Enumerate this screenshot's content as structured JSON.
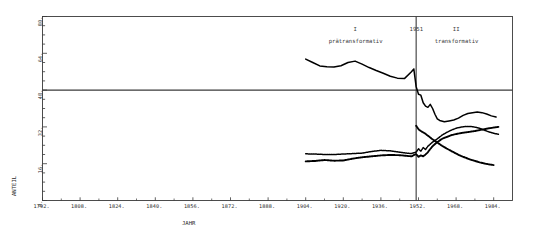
{
  "chart_data": {
    "type": "line",
    "title": "",
    "xlabel": "JAHR",
    "ylabel": "ANTEIL",
    "xlim": [
      1792,
      1992
    ],
    "ylim": [
      0,
      80
    ],
    "xticks": [
      1792,
      1808,
      1824,
      1840,
      1856,
      1872,
      1888,
      1904,
      1920,
      1936,
      1952,
      1968,
      1984
    ],
    "xtick_labels": [
      "1792.",
      "1808.",
      "1824.",
      "1840.",
      "1856.",
      "1872.",
      "1888.",
      "1904.",
      "1920.",
      "1936.",
      "1952.",
      "1968.",
      "1984."
    ],
    "yticks": [
      0,
      16,
      32,
      48,
      64,
      80
    ],
    "ytick_labels": [
      "0.",
      "16.",
      "32.",
      "48.",
      "64.",
      "80."
    ],
    "grid": false,
    "legend_position": "none",
    "reference_lines": [
      {
        "name": "horizontal-reference",
        "orientation": "horizontal",
        "value": 48
      },
      {
        "name": "period-divider-1951",
        "orientation": "vertical",
        "value": 1951,
        "label": "1951"
      }
    ],
    "annotations": [
      {
        "name": "period-I-numeral",
        "text": "I",
        "x": 1925,
        "y": 74
      },
      {
        "name": "period-I-name",
        "text": "prätransformativ",
        "x": 1925,
        "y": 69
      },
      {
        "name": "divider-year",
        "text": "1951",
        "x": 1951,
        "y": 74
      },
      {
        "name": "period-II-numeral",
        "text": "II",
        "x": 1968,
        "y": 74
      },
      {
        "name": "period-II-name",
        "text": "transformativ",
        "x": 1968,
        "y": 69
      }
    ],
    "series": [
      {
        "name": "series-top",
        "style": "solid-thick",
        "x": [
          1904,
          1907,
          1910,
          1913,
          1916,
          1919,
          1922,
          1925,
          1928,
          1931,
          1934,
          1937,
          1940,
          1943,
          1946,
          1949,
          1950,
          1951,
          1952,
          1953,
          1954,
          1955,
          1956,
          1957,
          1958,
          1959,
          1960,
          1961,
          1963,
          1965,
          1967,
          1969,
          1971,
          1973,
          1975,
          1977,
          1979,
          1981,
          1983,
          1985
        ],
        "values": [
          61.5,
          60.0,
          58.5,
          58.2,
          58.0,
          58.6,
          60.0,
          60.6,
          59.3,
          57.8,
          56.5,
          55.3,
          54.0,
          53.2,
          53.0,
          56.0,
          57.2,
          49.5,
          46.2,
          45.8,
          42.5,
          41.0,
          40.5,
          41.8,
          40.0,
          37.5,
          35.5,
          34.8,
          34.2,
          34.6,
          35.0,
          35.8,
          37.0,
          37.8,
          38.2,
          38.5,
          38.2,
          37.6,
          36.8,
          36.3
        ]
      },
      {
        "name": "series-middle",
        "style": "dotted",
        "x": [
          1904,
          1908,
          1912,
          1916,
          1920,
          1924,
          1928,
          1932,
          1936,
          1940,
          1944,
          1947,
          1949,
          1951,
          1952,
          1953,
          1954,
          1955,
          1956,
          1957,
          1958,
          1960,
          1962,
          1964,
          1966,
          1968,
          1970,
          1972,
          1974,
          1976,
          1978,
          1980,
          1982,
          1984,
          1986
        ],
        "values": [
          20.3,
          20.2,
          20.0,
          20.0,
          20.2,
          20.4,
          20.6,
          21.3,
          21.8,
          21.6,
          21.0,
          20.6,
          20.4,
          21.0,
          22.5,
          21.4,
          23.0,
          22.2,
          23.6,
          24.5,
          25.4,
          26.8,
          28.4,
          29.6,
          30.6,
          31.4,
          31.9,
          32.2,
          32.2,
          31.9,
          31.4,
          30.6,
          29.8,
          29.2,
          28.8
        ]
      },
      {
        "name": "series-bottom",
        "style": "dotted-thick",
        "x": [
          1904,
          1908,
          1912,
          1916,
          1920,
          1924,
          1928,
          1932,
          1936,
          1940,
          1944,
          1947,
          1949,
          1951,
          1952,
          1953,
          1954,
          1955,
          1956,
          1957,
          1958,
          1960,
          1962,
          1964,
          1966,
          1968,
          1970,
          1972,
          1974,
          1976,
          1978,
          1980,
          1982,
          1984,
          1986
        ],
        "values": [
          17.0,
          17.2,
          17.6,
          17.3,
          17.4,
          18.2,
          18.8,
          19.2,
          19.6,
          19.8,
          19.7,
          19.4,
          19.2,
          20.2,
          19.0,
          19.6,
          19.2,
          20.0,
          21.0,
          22.4,
          23.6,
          25.4,
          26.8,
          27.6,
          28.4,
          28.9,
          29.3,
          29.6,
          29.9,
          30.2,
          30.6,
          31.0,
          31.4,
          31.7,
          32.0
        ]
      },
      {
        "name": "series-descending",
        "style": "dotted-thick",
        "x": [
          1951,
          1952,
          1953,
          1954,
          1955,
          1956,
          1957,
          1958,
          1960,
          1962,
          1964,
          1966,
          1968,
          1970,
          1972,
          1974,
          1976,
          1978,
          1980,
          1982,
          1984
        ],
        "values": [
          32.5,
          31.0,
          30.2,
          29.6,
          29.0,
          28.2,
          27.4,
          26.6,
          25.2,
          23.8,
          22.6,
          21.5,
          20.4,
          19.4,
          18.6,
          17.8,
          17.2,
          16.6,
          16.1,
          15.7,
          15.4
        ]
      }
    ],
    "colors": {
      "line": "#000000",
      "axis": "#3a3a3a",
      "text": "#2b2b2b",
      "background": "#ffffff"
    }
  }
}
